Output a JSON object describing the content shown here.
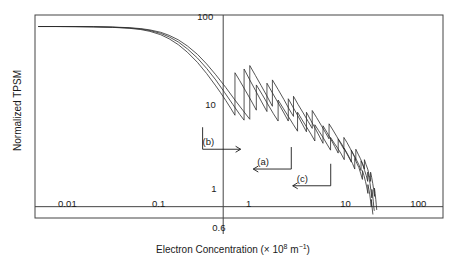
{
  "chart_data": {
    "type": "line",
    "title": "",
    "subtitle": "",
    "xlabel": "Electron Concentration (× 10⁸ m⁻¹)",
    "ylabel": "Normalized TPSM",
    "xscale": "log",
    "yscale": "log",
    "xlim": [
      0.006,
      130
    ],
    "ylim": [
      0.75,
      130
    ],
    "grid": false,
    "legend_position": "none",
    "x_tick_labels": [
      "0.01",
      "0.1",
      "1",
      "10",
      "100"
    ],
    "x_tick_values": [
      0.01,
      0.1,
      1,
      10,
      100
    ],
    "y_tick_labels": [
      "100",
      "10",
      "1"
    ],
    "y_tick_values": [
      100,
      10,
      1
    ],
    "special_x_marker": {
      "label": "0.6",
      "value": 0.6,
      "description": "vertical reference line extending below axis frame"
    },
    "reference_lines": [
      {
        "orientation": "horizontal",
        "value": 1,
        "label": "1"
      },
      {
        "orientation": "vertical",
        "value": 0.6,
        "label": "0.6"
      }
    ],
    "annotations": [
      {
        "label": "(a)",
        "arrow_direction": "left",
        "x_data": 1.6,
        "y_data": 2.6
      },
      {
        "label": "(b)",
        "arrow_direction": "right",
        "x_data": 0.42,
        "y_data": 4.3
      },
      {
        "label": "(c)",
        "arrow_direction": "left",
        "x_data": 4.2,
        "y_data": 1.7
      }
    ],
    "series": [
      {
        "name": "(a)",
        "description": "Normalized TPSM versus electron concentration; flat plateau near 100 at low concentration, smooth roll-off beginning near 0.1, then sawtooth oscillations with vertical jump discontinuities that compress toward high concentration.",
        "points": [
          [
            0.0065,
            97
          ],
          [
            0.01,
            97
          ],
          [
            0.016,
            96.8
          ],
          [
            0.025,
            96.4
          ],
          [
            0.04,
            95.4
          ],
          [
            0.06,
            93.6
          ],
          [
            0.08,
            91.0
          ],
          [
            0.1,
            87.6
          ],
          [
            0.13,
            81.5
          ],
          [
            0.16,
            74.5
          ],
          [
            0.2,
            65.5
          ],
          [
            0.25,
            55.0
          ],
          [
            0.32,
            43.5
          ],
          [
            0.4,
            33.5
          ],
          [
            0.5,
            25.0
          ],
          [
            0.62,
            18.2
          ],
          [
            0.76,
            13.4
          ],
          [
            0.9,
            10.4
          ],
          [
            1.0,
            9.0
          ],
          [
            1.0,
            33.0
          ],
          [
            1.15,
            25.0
          ],
          [
            1.32,
            19.2
          ],
          [
            1.52,
            14.6
          ],
          [
            1.75,
            11.2
          ],
          [
            1.75,
            23.0
          ],
          [
            2.0,
            18.0
          ],
          [
            2.3,
            14.0
          ],
          [
            2.65,
            10.8
          ],
          [
            2.95,
            8.8
          ],
          [
            2.95,
            15.5
          ],
          [
            3.3,
            12.6
          ],
          [
            3.7,
            10.2
          ],
          [
            4.2,
            8.0
          ],
          [
            4.6,
            6.7
          ],
          [
            4.6,
            11.0
          ],
          [
            5.1,
            9.0
          ],
          [
            5.7,
            7.3
          ],
          [
            6.3,
            6.0
          ],
          [
            6.9,
            5.0
          ],
          [
            6.9,
            7.8
          ],
          [
            7.6,
            6.6
          ],
          [
            8.4,
            5.5
          ],
          [
            9.2,
            4.6
          ],
          [
            10.0,
            3.9
          ],
          [
            10.0,
            5.6
          ],
          [
            10.9,
            4.9
          ],
          [
            11.8,
            4.2
          ],
          [
            12.8,
            3.6
          ],
          [
            13.8,
            3.1
          ],
          [
            13.8,
            4.2
          ],
          [
            14.7,
            3.7
          ],
          [
            15.6,
            3.3
          ],
          [
            16.6,
            2.9
          ],
          [
            17.5,
            2.5
          ],
          [
            17.5,
            3.2
          ],
          [
            18.3,
            2.9
          ],
          [
            19.1,
            2.5
          ],
          [
            19.9,
            2.2
          ],
          [
            20.6,
            1.9
          ],
          [
            20.6,
            2.4
          ],
          [
            21.2,
            2.1
          ],
          [
            21.8,
            1.8
          ],
          [
            22.3,
            1.5
          ],
          [
            22.8,
            1.25
          ],
          [
            22.8,
            1.55
          ],
          [
            23.2,
            1.35
          ],
          [
            23.6,
            1.15
          ],
          [
            23.9,
            1.0
          ],
          [
            24.2,
            0.9
          ]
        ]
      },
      {
        "name": "(b)",
        "description": "Second curve, shifted slightly left of (a); earlier roll-off and earlier onset of sawtooth jumps.",
        "points": [
          [
            0.0065,
            97
          ],
          [
            0.01,
            97
          ],
          [
            0.016,
            96.7
          ],
          [
            0.025,
            96.2
          ],
          [
            0.04,
            95.0
          ],
          [
            0.06,
            92.8
          ],
          [
            0.08,
            89.8
          ],
          [
            0.1,
            85.8
          ],
          [
            0.13,
            78.8
          ],
          [
            0.16,
            71.0
          ],
          [
            0.2,
            61.2
          ],
          [
            0.25,
            50.5
          ],
          [
            0.32,
            39.0
          ],
          [
            0.4,
            29.4
          ],
          [
            0.5,
            21.5
          ],
          [
            0.56,
            18.2
          ],
          [
            0.64,
            14.8
          ],
          [
            0.72,
            12.2
          ],
          [
            0.8,
            10.2
          ],
          [
            0.8,
            30.0
          ],
          [
            0.9,
            24.5
          ],
          [
            1.03,
            19.2
          ],
          [
            1.18,
            15.0
          ],
          [
            1.35,
            11.6
          ],
          [
            1.35,
            22.0
          ],
          [
            1.55,
            17.4
          ],
          [
            1.78,
            13.6
          ],
          [
            2.05,
            10.6
          ],
          [
            2.3,
            8.8
          ],
          [
            2.3,
            15.0
          ],
          [
            2.6,
            12.2
          ],
          [
            2.95,
            9.9
          ],
          [
            3.35,
            8.0
          ],
          [
            3.7,
            6.8
          ],
          [
            3.7,
            11.0
          ],
          [
            4.1,
            9.2
          ],
          [
            4.6,
            7.6
          ],
          [
            5.15,
            6.3
          ],
          [
            5.65,
            5.3
          ],
          [
            5.65,
            8.0
          ],
          [
            6.2,
            6.9
          ],
          [
            6.9,
            5.8
          ],
          [
            7.6,
            4.9
          ],
          [
            8.3,
            4.2
          ],
          [
            8.3,
            5.8
          ],
          [
            9.1,
            5.0
          ],
          [
            9.9,
            4.4
          ],
          [
            10.8,
            3.8
          ],
          [
            11.6,
            3.3
          ],
          [
            11.6,
            4.4
          ],
          [
            12.4,
            3.9
          ],
          [
            13.3,
            3.4
          ],
          [
            14.2,
            3.0
          ],
          [
            15.0,
            2.6
          ],
          [
            15.0,
            3.4
          ],
          [
            15.8,
            3.0
          ],
          [
            16.6,
            2.7
          ],
          [
            17.4,
            2.3
          ],
          [
            18.1,
            2.0
          ],
          [
            18.1,
            2.5
          ],
          [
            18.8,
            2.2
          ],
          [
            19.5,
            1.9
          ],
          [
            20.1,
            1.65
          ],
          [
            20.7,
            1.4
          ],
          [
            20.7,
            1.75
          ],
          [
            21.2,
            1.55
          ],
          [
            21.7,
            1.35
          ],
          [
            22.1,
            1.15
          ],
          [
            22.5,
            1.0
          ],
          [
            22.5,
            1.2
          ],
          [
            22.8,
            1.05
          ],
          [
            23.1,
            0.92
          ],
          [
            23.4,
            0.82
          ]
        ]
      },
      {
        "name": "(c)",
        "description": "Third curve, shifted slightly right of (a); latest roll-off, sawtooth jumps begin at highest concentration and converge with the others near 20.",
        "points": [
          [
            0.0065,
            97
          ],
          [
            0.01,
            97
          ],
          [
            0.016,
            96.9
          ],
          [
            0.025,
            96.6
          ],
          [
            0.04,
            95.8
          ],
          [
            0.06,
            94.2
          ],
          [
            0.08,
            92.0
          ],
          [
            0.1,
            89.0
          ],
          [
            0.13,
            83.8
          ],
          [
            0.16,
            77.5
          ],
          [
            0.2,
            69.2
          ],
          [
            0.25,
            59.2
          ],
          [
            0.32,
            47.8
          ],
          [
            0.4,
            37.5
          ],
          [
            0.5,
            28.5
          ],
          [
            0.64,
            20.6
          ],
          [
            0.8,
            15.0
          ],
          [
            0.98,
            11.4
          ],
          [
            1.15,
            9.2
          ],
          [
            1.15,
            36.0
          ],
          [
            1.32,
            28.0
          ],
          [
            1.52,
            21.6
          ],
          [
            1.75,
            16.6
          ],
          [
            2.0,
            12.8
          ],
          [
            2.0,
            25.0
          ],
          [
            2.3,
            19.6
          ],
          [
            2.65,
            15.2
          ],
          [
            3.0,
            12.0
          ],
          [
            3.35,
            9.9
          ],
          [
            3.35,
            16.5
          ],
          [
            3.75,
            13.4
          ],
          [
            4.25,
            10.8
          ],
          [
            4.8,
            8.7
          ],
          [
            5.3,
            7.3
          ],
          [
            5.3,
            11.5
          ],
          [
            5.9,
            9.6
          ],
          [
            6.6,
            7.9
          ],
          [
            7.3,
            6.6
          ],
          [
            8.0,
            5.6
          ],
          [
            8.0,
            8.2
          ],
          [
            8.8,
            7.0
          ],
          [
            9.7,
            5.9
          ],
          [
            10.6,
            5.0
          ],
          [
            11.5,
            4.3
          ],
          [
            11.5,
            5.8
          ],
          [
            12.4,
            5.1
          ],
          [
            13.4,
            4.4
          ],
          [
            14.4,
            3.8
          ],
          [
            15.4,
            3.3
          ],
          [
            15.4,
            4.3
          ],
          [
            16.3,
            3.8
          ],
          [
            17.2,
            3.4
          ],
          [
            18.1,
            3.0
          ],
          [
            19.0,
            2.6
          ],
          [
            19.0,
            3.3
          ],
          [
            19.8,
            2.9
          ],
          [
            20.6,
            2.6
          ],
          [
            21.4,
            2.2
          ],
          [
            22.1,
            1.9
          ],
          [
            22.1,
            2.4
          ],
          [
            22.7,
            2.1
          ],
          [
            23.3,
            1.8
          ],
          [
            23.8,
            1.55
          ],
          [
            24.3,
            1.3
          ],
          [
            24.3,
            1.6
          ],
          [
            24.7,
            1.4
          ],
          [
            25.1,
            1.2
          ],
          [
            25.4,
            1.05
          ],
          [
            25.7,
            0.92
          ]
        ]
      }
    ]
  },
  "figure": {
    "frame_color": "#444444",
    "curve_color": "#2b2b2b",
    "annotation_color": "#1a1a1a"
  }
}
